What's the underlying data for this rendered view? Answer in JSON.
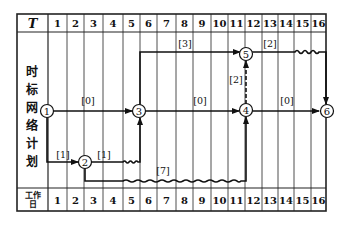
{
  "header": {
    "corner_label": "T",
    "columns": [
      "1",
      "2",
      "3",
      "4",
      "5",
      "6",
      "7",
      "8",
      "9",
      "10",
      "11",
      "12",
      "13",
      "14",
      "15",
      "16"
    ]
  },
  "side_label_chars": [
    "时",
    "标",
    "网",
    "络",
    "计",
    "划"
  ],
  "footer": {
    "label_line1": "工作",
    "label_line2": "日",
    "columns": [
      "1",
      "2",
      "3",
      "4",
      "5",
      "6",
      "7",
      "8",
      "9",
      "10",
      "11",
      "12",
      "13",
      "14",
      "15",
      "16"
    ]
  },
  "nodes": [
    {
      "id": "1",
      "label": "1"
    },
    {
      "id": "2",
      "label": "2"
    },
    {
      "id": "3",
      "label": "3"
    },
    {
      "id": "4",
      "label": "4"
    },
    {
      "id": "5",
      "label": "5"
    },
    {
      "id": "6",
      "label": "6"
    }
  ],
  "activities": [
    {
      "from": "1",
      "to": "3",
      "float_label": "[0]",
      "type": "solid"
    },
    {
      "from": "1",
      "to": "2",
      "float_label": "[1]",
      "type": "solid"
    },
    {
      "from": "2",
      "to": "3",
      "float_label": "[1]",
      "type": "solid+wavy"
    },
    {
      "from": "2",
      "to": "4",
      "float_label": "[7]",
      "type": "solid+wavy"
    },
    {
      "from": "3",
      "to": "5",
      "float_label": "[3]",
      "type": "solid"
    },
    {
      "from": "3",
      "to": "4",
      "float_label": "[0]",
      "type": "solid"
    },
    {
      "from": "4",
      "to": "5",
      "float_label": "[2]",
      "type": "dummy-dashed"
    },
    {
      "from": "5",
      "to": "6",
      "float_label": "[2]",
      "type": "solid+wavy"
    },
    {
      "from": "4",
      "to": "6",
      "float_label": "[0]",
      "type": "solid"
    }
  ],
  "labels": {
    "a13": "[0]",
    "a12": "[1]",
    "a23": "[1]",
    "a24": "[7]",
    "a35": "[3]",
    "a34": "[0]",
    "a45": "[2]",
    "a56": "[2]",
    "a46": "[0]"
  },
  "colors": {
    "line": "#111111",
    "grid": "#222222",
    "background": "#ffffff"
  }
}
